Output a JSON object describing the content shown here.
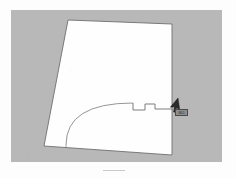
{
  "document": {
    "title": "Site Plan Sketch",
    "background_color": "#fdfdfd",
    "panel_color": "#b8b8b8",
    "lot_fill_color": "#fefefe",
    "line_color": "#6b6b6b"
  },
  "panel": {
    "x": 11,
    "y": 10,
    "width": 211,
    "height": 152
  },
  "lot": {
    "label": "lot-outline",
    "corners": [
      {
        "name": "top-left",
        "x": 68,
        "y": 20
      },
      {
        "name": "top-right",
        "x": 172,
        "y": 24
      },
      {
        "name": "bottom-right",
        "x": 172,
        "y": 155
      },
      {
        "name": "bottom-left",
        "x": 44,
        "y": 146
      }
    ]
  },
  "arc": {
    "label": "curved-boundary",
    "start": {
      "x": 66,
      "y": 145
    },
    "end": {
      "x": 133,
      "y": 103
    },
    "control": {
      "x": 66,
      "y": 103
    }
  },
  "notch": {
    "label": "stepped-profile",
    "points": [
      {
        "x": 133,
        "y": 103
      },
      {
        "x": 133,
        "y": 110
      },
      {
        "x": 145,
        "y": 110
      },
      {
        "x": 145,
        "y": 104
      },
      {
        "x": 155,
        "y": 104
      },
      {
        "x": 155,
        "y": 109
      },
      {
        "x": 172,
        "y": 109
      }
    ]
  },
  "cursor": {
    "name": "mouse-pointer",
    "x": 178,
    "y": 98,
    "rotation_deg": 40,
    "color": "#2b2b2b"
  },
  "tooltip": {
    "name": "cursor-tooltip",
    "text": "84.1",
    "x": 175,
    "y": 109,
    "width": 13,
    "height": 7,
    "background": "#8e8e8e",
    "border_color": "#4a4a4a"
  },
  "baseline_mark": {
    "name": "bottom-tick",
    "x": 103,
    "y": 170,
    "width": 22
  }
}
